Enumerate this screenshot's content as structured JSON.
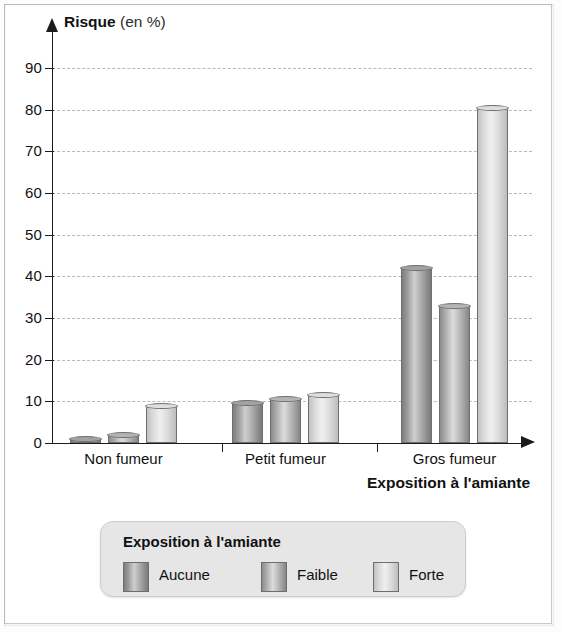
{
  "chart_data": {
    "type": "bar",
    "title": "",
    "ylabel_strong": "Risque",
    "ylabel_light": "(en %)",
    "ylabel": "Risque (en %)",
    "xlabel": "Exposition à l'amiante",
    "categories": [
      "Non fumeur",
      "Petit fumeur",
      "Gros fumeur"
    ],
    "series": [
      {
        "name": "Aucune",
        "color": "#9a9a9a",
        "values": [
          1,
          9.5,
          42
        ]
      },
      {
        "name": "Faible",
        "color": "#b4b4b4",
        "values": [
          2,
          10.5,
          33
        ]
      },
      {
        "name": "Forte",
        "color": "#dedede",
        "values": [
          9,
          11.5,
          80.5
        ]
      }
    ],
    "yticks": [
      0,
      10,
      20,
      30,
      40,
      50,
      60,
      70,
      80,
      90
    ],
    "ylim": [
      0,
      95
    ],
    "grid": true,
    "grid_style": "dashed",
    "legend_position": "bottom"
  },
  "legend": {
    "title": "Exposition à l'amiante",
    "entries": [
      "Aucune",
      "Faible",
      "Forte"
    ]
  },
  "axes": {
    "y_title_strong": "Risque",
    "y_title_light": "(en %)",
    "x_title": "Exposition à l'amiante"
  },
  "ghost_text": {
    "line1": "ence aux amiante",
    "line2": "Exposition cumulee"
  }
}
